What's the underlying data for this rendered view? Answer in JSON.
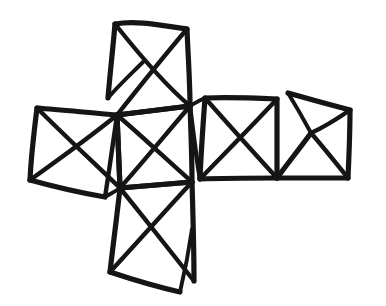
{
  "figure": {
    "name": "hand-drawn-polyhedron-net",
    "title": "Hand-drawn cross-shaped net of six squares",
    "medium": "ink-sketch",
    "background_color": "#ffffff",
    "ink_color": "#151515",
    "canvas": {
      "width": 386,
      "height": 306
    },
    "stroke_widths": {
      "outline": 5.2,
      "diagonal": 4.4,
      "thin": 3.9
    },
    "face_count": 6,
    "faces": [
      {
        "id": "face-top",
        "label": "top square",
        "corners": [
          [
            115,
            24
          ],
          [
            187,
            29
          ],
          [
            190,
            106
          ],
          [
            117,
            115
          ]
        ],
        "notch": true,
        "notch_point": [
          108,
          98
        ]
      },
      {
        "id": "face-left",
        "label": "left square",
        "corners": [
          [
            37,
            108
          ],
          [
            117,
            115
          ],
          [
            120,
            188
          ],
          [
            30,
            180
          ]
        ],
        "notch": true,
        "notch_point": [
          105,
          197
        ]
      },
      {
        "id": "face-center",
        "label": "center square",
        "corners": [
          [
            117,
            115
          ],
          [
            190,
            106
          ],
          [
            192,
            182
          ],
          [
            120,
            188
          ]
        ],
        "notch": false,
        "notch_point": null
      },
      {
        "id": "face-bottom",
        "label": "bottom square",
        "corners": [
          [
            120,
            188
          ],
          [
            192,
            182
          ],
          [
            194,
            281
          ],
          [
            110,
            272
          ]
        ],
        "notch": true,
        "notch_point": [
          180,
          292
        ]
      },
      {
        "id": "face-right-inner",
        "label": "inner right square",
        "corners": [
          [
            205,
            98
          ],
          [
            277,
            99
          ],
          [
            277,
            178
          ],
          [
            200,
            179
          ]
        ],
        "notch": false,
        "notch_point": null
      },
      {
        "id": "face-right-outer",
        "label": "outer right square",
        "corners": [
          [
            288,
            93
          ],
          [
            350,
            110
          ],
          [
            348,
            178
          ],
          [
            277,
            178
          ]
        ],
        "notch": true,
        "notch_point": [
          311,
          133
        ]
      }
    ],
    "crossings": [
      {
        "id": "crossing-top",
        "point": [
          152,
          70
        ]
      },
      {
        "id": "crossing-left",
        "point": [
          78,
          148
        ]
      },
      {
        "id": "crossing-center",
        "point": [
          155,
          148
        ]
      },
      {
        "id": "crossing-bottom",
        "point": [
          155,
          233
        ]
      },
      {
        "id": "crossing-right-inner",
        "point": [
          239,
          138
        ]
      },
      {
        "id": "crossing-right-outer",
        "point": [
          313,
          140
        ]
      }
    ],
    "junctions": [
      {
        "id": "junction-upper-left",
        "point": [
          117,
          115
        ],
        "degree": 6
      },
      {
        "id": "junction-upper-right",
        "point": [
          190,
          106
        ],
        "degree": 6
      },
      {
        "id": "junction-lower-left",
        "point": [
          120,
          188
        ],
        "degree": 6
      },
      {
        "id": "junction-lower-right",
        "point": [
          192,
          182
        ],
        "degree": 6
      }
    ]
  }
}
